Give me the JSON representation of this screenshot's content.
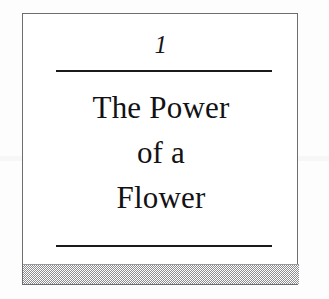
{
  "page": {
    "background_color": "#fdfdfd",
    "box_border_color": "#6e6e72",
    "rule_color": "#1a1a1d",
    "text_color": "#121214",
    "band_color": "#8d8d91"
  },
  "chapter": {
    "number": "1",
    "title_lines": [
      {
        "text": "The Power"
      },
      {
        "text": "of a"
      },
      {
        "text": "Flower"
      }
    ],
    "title_full": "The Power of a Flower"
  },
  "decorations": {
    "rule_top_name": "horizontal-rule-above-title",
    "rule_bottom_name": "horizontal-rule-below-title",
    "bottom_band_name": "dithered-gray-band"
  }
}
